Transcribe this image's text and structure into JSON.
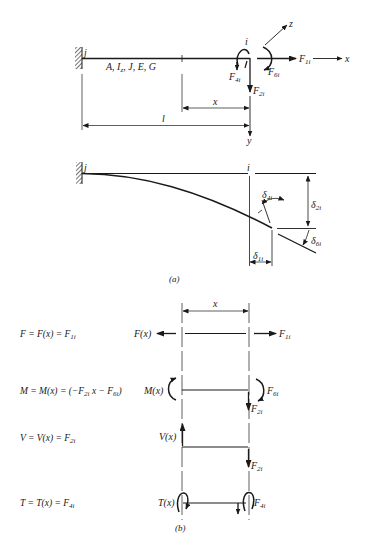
{
  "figure": {
    "part_a": {
      "caption": "(a)",
      "beam_top": {
        "end_j_label": "j",
        "end_i_label": "i",
        "properties_label": "A, I_z, J, E, G",
        "properties": [
          "A",
          "I",
          "z",
          "J",
          "E",
          "G"
        ],
        "axes": {
          "x": "x",
          "y": "y",
          "z": "z"
        },
        "forces": [
          {
            "name": "F",
            "sub": "1i",
            "direction": "axial (+x)"
          },
          {
            "name": "F",
            "sub": "2i",
            "direction": "transverse (+y, downward)"
          },
          {
            "name": "F",
            "sub": "4i",
            "direction": "torsion moment about x"
          },
          {
            "name": "F",
            "sub": "6i",
            "direction": "bending moment about z"
          }
        ],
        "dimensions": {
          "x_label": "x",
          "length_label": "l"
        }
      },
      "deflected_shape": {
        "end_j_label": "j",
        "end_i_label": "i",
        "displacements": [
          {
            "name": "δ",
            "sub": "1i",
            "meaning": "axial displacement"
          },
          {
            "name": "δ",
            "sub": "2i",
            "meaning": "transverse deflection"
          },
          {
            "name": "δ",
            "sub": "4i",
            "meaning": "twist angle"
          },
          {
            "name": "δ",
            "sub": "6i",
            "meaning": "end slope rotation"
          }
        ]
      }
    },
    "part_b": {
      "caption": "(b)",
      "dimension_label": "x",
      "rows": [
        {
          "equation": {
            "lhs": "F = F(x) = F",
            "sub": "1i",
            "rest": ""
          },
          "left_label": "F(x)",
          "right_label": {
            "name": "F",
            "sub": "1i"
          }
        },
        {
          "equation": {
            "lhs": "M = M(x) = (−F",
            "sub": "2i",
            "mid": "x − F",
            "sub2": "6i",
            "rest": ")"
          },
          "left_label": "M(x)",
          "right_label": {
            "name": "F",
            "sub": "6i"
          },
          "right_label2": {
            "name": "F",
            "sub": "2i"
          }
        },
        {
          "equation": {
            "lhs": "V = V(x) = F",
            "sub": "2i",
            "rest": ""
          },
          "left_label": "V(x)",
          "right_label": {
            "name": "F",
            "sub": "2i"
          }
        },
        {
          "equation": {
            "lhs": "T = T(x) = F",
            "sub": "4i",
            "rest": ""
          },
          "left_label": "T(x)",
          "right_label": {
            "name": "F",
            "sub": "4i"
          }
        }
      ]
    }
  }
}
